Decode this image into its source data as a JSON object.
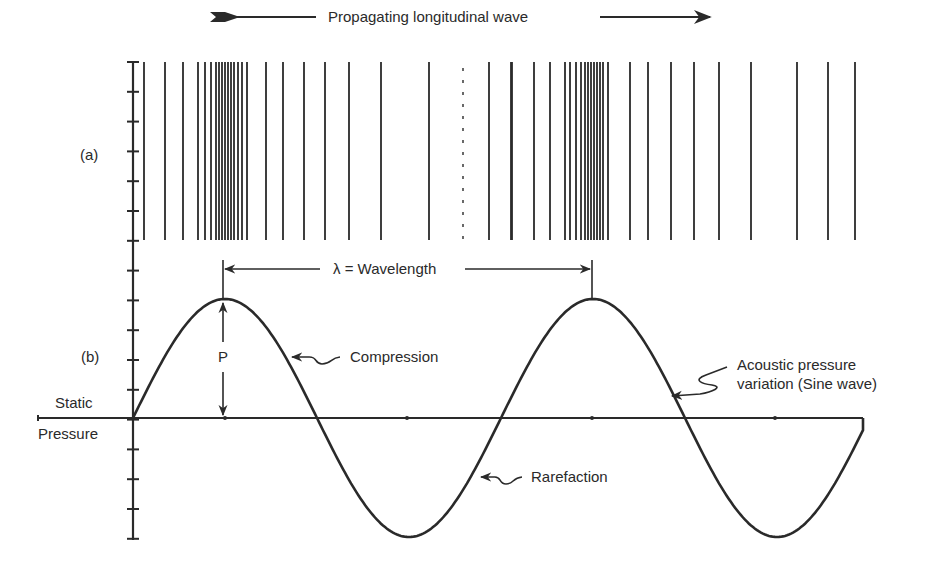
{
  "title_arrow": {
    "label": "Propagating longitudinal wave"
  },
  "panel_a": {
    "label": "(a)"
  },
  "panel_b": {
    "label": "(b)"
  },
  "axis": {
    "static_label": "Static",
    "pressure_label": "Pressure"
  },
  "wavelength": {
    "label": "λ = Wavelength"
  },
  "amplitude": {
    "label": "P"
  },
  "annotations": {
    "compression": "Compression",
    "rarefaction": "Rarefaction",
    "sine_line1": "Acoustic pressure",
    "sine_line2": "variation (Sine wave)"
  },
  "colors": {
    "ink": "#2a2a2a",
    "background": "#ffffff"
  },
  "geometry": {
    "axis_x": 133,
    "axis_top": 62,
    "axis_bottom": 540,
    "tick_spacing": 29.8,
    "baseline_y": 418,
    "baseline_left": 38,
    "baseline_right": 863,
    "sine_start_x": 133,
    "wavelength_px": 368,
    "amplitude_px": 119,
    "sine_end_x": 863,
    "lines_top": 62,
    "lines_bottom": 240,
    "baseline_dots_x": [
      225,
      407,
      592,
      775
    ]
  },
  "particle_lines_x": [
    144,
    165,
    183,
    198,
    205,
    211,
    216,
    219,
    222,
    225,
    228,
    231,
    234,
    238,
    242,
    247,
    266,
    283,
    304,
    325,
    349,
    381,
    429,
    489,
    511,
    512,
    534,
    550,
    565,
    570,
    576,
    581,
    585,
    588,
    591,
    594,
    597,
    600,
    603,
    608,
    630,
    648,
    671,
    694,
    719,
    751,
    797,
    828,
    855
  ],
  "particle_lines_dashed_x": [
    463
  ]
}
